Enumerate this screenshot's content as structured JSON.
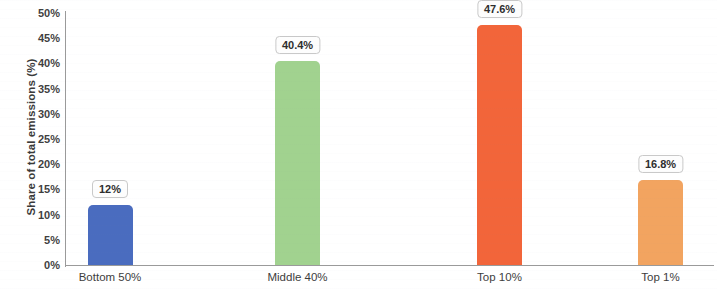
{
  "chart_data": {
    "type": "bar",
    "title": "",
    "xlabel": "",
    "ylabel": "Share of total emissions (%)",
    "categories": [
      "Bottom 50%",
      "Middle 40%",
      "Top 10%",
      "Top 1%"
    ],
    "values": [
      12,
      40.4,
      47.6,
      16.8
    ],
    "value_labels": [
      "12%",
      "40.4%",
      "47.6%",
      "16.8%"
    ],
    "bar_colors": [
      "#4a6cbf",
      "#a1d28f",
      "#f2653a",
      "#f2a460"
    ],
    "ylim": [
      0,
      50
    ],
    "ytick_values": [
      0,
      5,
      10,
      15,
      20,
      25,
      30,
      35,
      40,
      45,
      50
    ],
    "ytick_labels": [
      "0%",
      "5%",
      "10%",
      "15%",
      "20%",
      "25%",
      "30%",
      "35%",
      "40%",
      "45%",
      "50%"
    ],
    "grid": false,
    "legend": "none",
    "data_labels_shown": true,
    "background_color": "#ffffff",
    "axis_color": "#9a9a9a"
  },
  "axis": {
    "y_title": "Share of total emissions (%)"
  },
  "ticks": {
    "y": [
      {
        "label": "50%",
        "value": 50
      },
      {
        "label": "45%",
        "value": 45
      },
      {
        "label": "40%",
        "value": 40
      },
      {
        "label": "35%",
        "value": 35
      },
      {
        "label": "30%",
        "value": 30
      },
      {
        "label": "25%",
        "value": 25
      },
      {
        "label": "20%",
        "value": 20
      },
      {
        "label": "15%",
        "value": 15
      },
      {
        "label": "10%",
        "value": 10
      },
      {
        "label": "5%",
        "value": 5
      },
      {
        "label": "0%",
        "value": 0
      }
    ]
  },
  "bars": [
    {
      "category": "Bottom 50%",
      "value": 12,
      "label": "12%",
      "color": "#4a6cbf"
    },
    {
      "category": "Middle 40%",
      "value": 40.4,
      "label": "40.4%",
      "color": "#a1d28f"
    },
    {
      "category": "Top 10%",
      "value": 47.6,
      "label": "47.6%",
      "color": "#f2653a"
    },
    {
      "category": "Top 1%",
      "value": 16.8,
      "label": "16.8%",
      "color": "#f2a460"
    }
  ]
}
